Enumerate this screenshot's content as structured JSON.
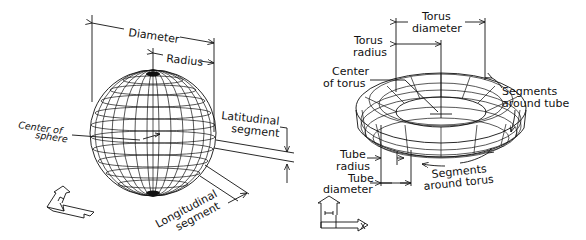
{
  "sphere": {
    "labels": {
      "diameter": "Diameter",
      "radius": "Radius",
      "latitudinal_1": "Latitudinal",
      "latitudinal_2": "segment",
      "center_1": "Center of",
      "center_2": "sphere",
      "longitudinal_1": "Longitudinal",
      "longitudinal_2": "segment"
    }
  },
  "torus": {
    "labels": {
      "torus_diameter_1": "Torus",
      "torus_diameter_2": "diameter",
      "torus_radius_1": "Torus",
      "torus_radius_2": "radius",
      "center_1": "Center",
      "center_2": "of torus",
      "segments_tube_1": "Segments",
      "segments_tube_2": "around tube",
      "tube_radius_1": "Tube",
      "tube_radius_2": "radius",
      "tube_diameter_1": "Tube",
      "tube_diameter_2": "diameter",
      "segments_torus_1": "Segments",
      "segments_torus_2": "around torus"
    }
  },
  "ucs_icons": [
    "ucs-isometric-icon",
    "ucs-front-icon"
  ]
}
